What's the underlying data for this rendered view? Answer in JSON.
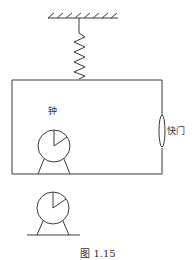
{
  "figure": {
    "caption": "图 1.15",
    "labels": {
      "clock_upper": "钟",
      "shutter": "快门"
    },
    "components": [
      {
        "name": "ceiling",
        "type": "fixed-support"
      },
      {
        "name": "spring",
        "type": "spring"
      },
      {
        "name": "frame",
        "type": "rectangular-box"
      },
      {
        "name": "clock-in-box",
        "type": "clock"
      },
      {
        "name": "shutter",
        "type": "shutter"
      },
      {
        "name": "clock-outside",
        "type": "clock"
      }
    ]
  }
}
